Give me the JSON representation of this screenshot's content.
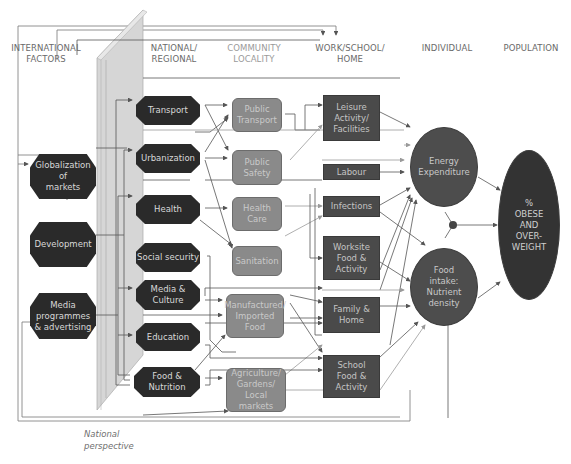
{
  "headers": [
    {
      "id": "international",
      "label": "INTERNATIONAL FACTORS",
      "line1": "INTERNATIONAL",
      "line2": "FACTORS"
    },
    {
      "id": "national",
      "label": "NATIONAL/ REGIONAL",
      "line1": "NATIONAL/",
      "line2": "REGIONAL"
    },
    {
      "id": "community",
      "label": "COMMUNITY LOCALITY",
      "line1": "COMMUNITY",
      "line2": "LOCALITY"
    },
    {
      "id": "work",
      "label": "WORK/SCHOOL/ HOME",
      "line1": "WORK/SCHOOL/",
      "line2": "HOME"
    },
    {
      "id": "individual",
      "label": "INDIVIDUAL",
      "line1": "INDIVIDUAL",
      "line2": ""
    },
    {
      "id": "population",
      "label": "POPULATION",
      "line1": "POPULATION",
      "line2": ""
    }
  ],
  "international": [
    {
      "label": "Globalization of markets",
      "lines": [
        "Globalization",
        "of",
        "markets"
      ]
    },
    {
      "label": "Development",
      "lines": [
        "Development"
      ]
    },
    {
      "label": "Media programmes & advertising",
      "lines": [
        "Media",
        "programmes",
        "& advertising"
      ]
    }
  ],
  "national": [
    {
      "label": "Transport",
      "lines": [
        "Transport"
      ]
    },
    {
      "label": "Urbanization",
      "lines": [
        "Urbanization"
      ]
    },
    {
      "label": "Health",
      "lines": [
        "Health"
      ]
    },
    {
      "label": "Social security",
      "lines": [
        "Social security"
      ]
    },
    {
      "label": "Media & Culture",
      "lines": [
        "Media &",
        "Culture"
      ]
    },
    {
      "label": "Education",
      "lines": [
        "Education"
      ]
    },
    {
      "label": "Food & Nutrition",
      "lines": [
        "Food &",
        "Nutrition"
      ]
    }
  ],
  "community": [
    {
      "label": "Public Transport",
      "lines": [
        "Public",
        "Transport"
      ]
    },
    {
      "label": "Public Safety",
      "lines": [
        "Public",
        "Safety"
      ]
    },
    {
      "label": "Health Care",
      "lines": [
        "Health",
        "Care"
      ]
    },
    {
      "label": "Sanitation",
      "lines": [
        "Sanitation"
      ]
    },
    {
      "label": "Manufactured/ Imported Food",
      "lines": [
        "Manufactured/",
        "Imported",
        "Food"
      ]
    },
    {
      "label": "Agriculture/ Gardens/ Local markets",
      "lines": [
        "Agriculture/",
        "Gardens/",
        "Local markets"
      ]
    }
  ],
  "work_school_home": [
    {
      "label": "Leisure Activity/ Facilities",
      "lines": [
        "Leisure",
        "Activity/",
        "Facilities"
      ]
    },
    {
      "label": "Labour",
      "lines": [
        "Labour"
      ]
    },
    {
      "label": "Infections",
      "lines": [
        "Infections"
      ]
    },
    {
      "label": "Worksite Food & Activity",
      "lines": [
        "Worksite",
        "Food &",
        "Activity"
      ]
    },
    {
      "label": "Family & Home",
      "lines": [
        "Family &",
        "Home"
      ]
    },
    {
      "label": "School Food & Activity",
      "lines": [
        "School",
        "Food &",
        "Activity"
      ]
    }
  ],
  "individual": [
    {
      "label": "Energy Expenditure",
      "lines": [
        "Energy",
        "Expenditure"
      ]
    },
    {
      "label": "Food intake: Nutrient density",
      "lines": [
        "Food",
        "intake:",
        "Nutrient",
        "density"
      ]
    }
  ],
  "population": {
    "label": "% OBESE AND OVER-WEIGHT",
    "lines": [
      "%",
      "OBESE",
      "AND",
      "OVER-",
      "WEIGHT"
    ]
  },
  "national_perspective": {
    "label": "National perspective",
    "lines": [
      "National",
      "perspective"
    ]
  },
  "colors": {
    "national_node": "#2a2a2a",
    "community_node": "#8a8a8a",
    "work_node": "#4a4a4a",
    "individual_node": "#4d4d4d",
    "population_node": "#333333",
    "panel": "#d6d6d6",
    "line": "#555555",
    "line_light": "#9a9a9a"
  }
}
